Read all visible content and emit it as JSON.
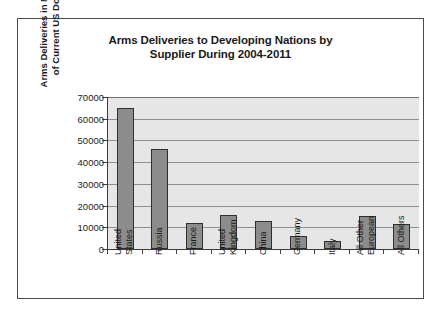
{
  "chart_data": {
    "type": "bar",
    "title": "Arms Deliveries to Developing Nations by Supplier During 2004-2011",
    "title_lines": [
      "Arms Deliveries to Developing Nations by",
      "Supplier During 2004-2011"
    ],
    "xlabel": "",
    "ylabel": "Arms Deliveries in Millions of Current US Dollars",
    "ylabel_lines": [
      "Arms Deliveries in Millions",
      "of Current US Dollars"
    ],
    "categories": [
      "United States",
      "Russia",
      "France",
      "United Kingdom",
      "China",
      "Germany",
      "Italy",
      "All Other European",
      "All Others"
    ],
    "category_lines": [
      [
        "United",
        "States"
      ],
      [
        "Russia"
      ],
      [
        "France"
      ],
      [
        "United",
        "Kingdom"
      ],
      [
        "China"
      ],
      [
        "Germany"
      ],
      [
        "Italy"
      ],
      [
        "All Other",
        "European"
      ],
      [
        "All Others"
      ]
    ],
    "values": [
      65000,
      46000,
      11800,
      15500,
      12800,
      6200,
      3700,
      15300,
      11300
    ],
    "ylim": [
      0,
      70000
    ],
    "ytick_values": [
      70000,
      60000,
      50000,
      40000,
      30000,
      20000,
      10000,
      0
    ],
    "ytick_labels": [
      "70000",
      "60000",
      "50000",
      "40000",
      "30000",
      "20000",
      "10000",
      "0"
    ],
    "grid": true,
    "legend": false,
    "legend_position": "none",
    "colors": {
      "bar_fill": "#8c8c8c",
      "bar_border": "#2f2f2f",
      "plot_background": "#e6e6e6",
      "gridline": "#8f8f8f",
      "axis": "#3d3d3d",
      "frame_border": "#4a4a4a",
      "text": "#1a1a1a",
      "page_background": "#ffffff"
    }
  }
}
